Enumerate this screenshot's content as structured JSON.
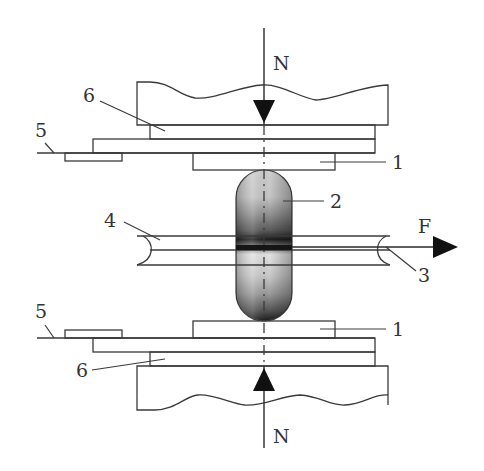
{
  "diagram": {
    "labels": {
      "force_top": "N",
      "force_bottom": "N",
      "force_pull": "F",
      "pad_top": "1",
      "pad_bottom": "1",
      "capsule": "2",
      "tube_right": "3",
      "tube_left": "4",
      "line_top": "5",
      "line_bottom": "5",
      "plate_top": "6",
      "plate_bottom": "6"
    },
    "components": [
      {
        "id": "1",
        "name": "contact pad"
      },
      {
        "id": "2",
        "name": "capsule"
      },
      {
        "id": "3",
        "name": "tube (right end)"
      },
      {
        "id": "4",
        "name": "tube (left end)"
      },
      {
        "id": "5",
        "name": "base line / support"
      },
      {
        "id": "6",
        "name": "plate"
      }
    ],
    "forces": [
      {
        "symbol": "N",
        "direction": "down",
        "position": "top"
      },
      {
        "symbol": "N",
        "direction": "up",
        "position": "bottom"
      },
      {
        "symbol": "F",
        "direction": "right",
        "position": "tube"
      }
    ],
    "colors": {
      "line": "#3a3a3a",
      "arrow": "#111111",
      "capsule_light": "#d9d9d9",
      "capsule_dark": "#1e1e1e"
    }
  }
}
